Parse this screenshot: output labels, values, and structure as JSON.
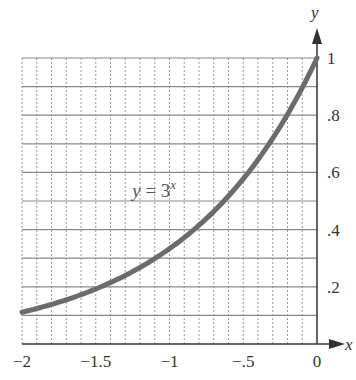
{
  "chart_data": {
    "type": "line",
    "title": "",
    "xlabel": "x",
    "ylabel": "y",
    "xlim": [
      -2,
      0
    ],
    "ylim": [
      0,
      1
    ],
    "grid": true,
    "x_ticks": [
      -2,
      -1.5,
      -1,
      -0.5,
      0
    ],
    "x_tick_labels": [
      "−2",
      "−1.5",
      "−1",
      "−.5",
      "0"
    ],
    "y_ticks": [
      0.2,
      0.4,
      0.6,
      0.8,
      1
    ],
    "y_tick_labels": [
      ".2",
      ".4",
      ".6",
      ".8",
      "1"
    ],
    "series": [
      {
        "name": "y = 3^x",
        "function": "3^x",
        "x": [
          -2,
          -1.75,
          -1.5,
          -1.25,
          -1,
          -0.75,
          -0.5,
          -0.25,
          0
        ],
        "y": [
          0.111,
          0.146,
          0.192,
          0.253,
          0.333,
          0.439,
          0.577,
          0.76,
          1.0
        ],
        "color": "#6b6b6b"
      }
    ],
    "annotations": [
      {
        "text_base": "y = 3",
        "text_sup": "x",
        "x": -0.88,
        "y": 0.6
      }
    ]
  }
}
